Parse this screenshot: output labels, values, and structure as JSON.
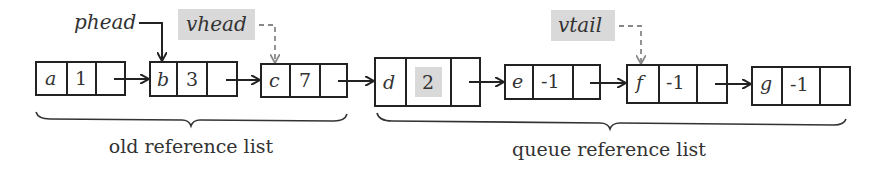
{
  "diagram": {
    "pointers": {
      "phead": {
        "label": "phead",
        "points_to": "b",
        "style": "solid"
      },
      "vhead": {
        "label": "vhead",
        "points_to": "c",
        "style": "dashed",
        "highlighted": true
      },
      "vtail": {
        "label": "vtail",
        "points_to": "f",
        "style": "dashed",
        "highlighted": true
      }
    },
    "nodes": [
      {
        "id": "a",
        "value": "1"
      },
      {
        "id": "b",
        "value": "3"
      },
      {
        "id": "c",
        "value": "7"
      },
      {
        "id": "d",
        "value": "2",
        "value_highlighted": true
      },
      {
        "id": "e",
        "value": "-1"
      },
      {
        "id": "f",
        "value": "-1"
      },
      {
        "id": "g",
        "value": "-1"
      }
    ],
    "groups": {
      "old": {
        "label": "old reference list",
        "nodes": [
          "a",
          "b",
          "c"
        ]
      },
      "queue": {
        "label": "queue reference list",
        "nodes": [
          "d",
          "e",
          "f",
          "g"
        ]
      }
    },
    "colors": {
      "stroke": "#222222",
      "highlight": "#d9d9d9",
      "dashed": "#888888"
    }
  }
}
